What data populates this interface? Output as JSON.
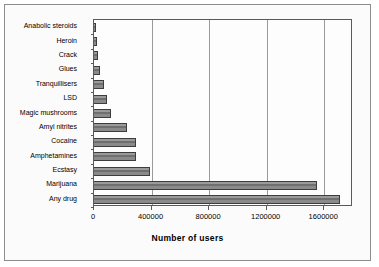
{
  "chart_data": {
    "type": "bar",
    "orientation": "horizontal",
    "title": "",
    "xlabel": "Number of users",
    "ylabel": "",
    "xlim": [
      0,
      1800000
    ],
    "xticks": [
      0,
      400000,
      800000,
      1200000,
      1600000
    ],
    "xtick_labels": [
      "0",
      "400000",
      "800000",
      "1200000",
      "1600000"
    ],
    "grid": "vertical",
    "legend": "none",
    "categories": [
      "Anabolic steroids",
      "Heroin",
      "Crack",
      "Glues",
      "Tranquillisers",
      "LSD",
      "Magic mushrooms",
      "Amyl nitrites",
      "Cocaine",
      "Amphetamines",
      "Ecstasy",
      "Marijuana",
      "Any drug"
    ],
    "values": [
      15000,
      20000,
      30000,
      40000,
      70000,
      90000,
      115000,
      230000,
      290000,
      290000,
      390000,
      1550000,
      1710000
    ],
    "bar_fill_color": "#848484",
    "bar_edge_color": "#3d3d3d",
    "gridline_color": "#9a9a9a",
    "axis_color": "#5a5a5a",
    "plot_background": "#fdfdfd",
    "figure_background": "#fbfbfb"
  }
}
